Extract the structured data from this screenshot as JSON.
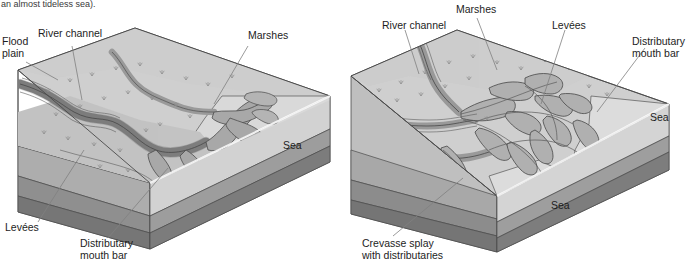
{
  "figure": {
    "caption_fragment": "an almost tideless sea).",
    "type": "block-diagram",
    "panels": 2
  },
  "colors": {
    "plain_top": "#c9c9c9",
    "plain_top_light": "#d6d6d6",
    "channel_fill": "#a6a6a6",
    "channel_dark": "#8f8f8f",
    "sea_surface": "#cfcfcf",
    "sea_light": "#e2e2e2",
    "block_face_upper": "#bdbdbd",
    "block_face_mid": "#9a9a9a",
    "block_face_lower": "#808080",
    "block_face_base": "#6f6f6f",
    "outline": "#4a4a4a",
    "leader": "#777777",
    "text": "#1d1d1d"
  },
  "left_panel": {
    "name": "birds-foot-delta-simple",
    "labels": [
      {
        "id": "flood-plain",
        "text": "Flood\nplain",
        "line1": "Flood",
        "line2": "plain"
      },
      {
        "id": "river-channel",
        "text": "River channel",
        "line1": "River channel",
        "line2": ""
      },
      {
        "id": "marshes",
        "text": "Marshes",
        "line1": "Marshes",
        "line2": ""
      },
      {
        "id": "sea",
        "text": "Sea",
        "line1": "Sea",
        "line2": ""
      },
      {
        "id": "levees",
        "text": "Levées",
        "line1": "Levées",
        "line2": ""
      },
      {
        "id": "distributary-mouth-bar",
        "text": "Distributary\nmouth bar",
        "line1": "Distributary",
        "line2": "mouth bar"
      }
    ]
  },
  "right_panel": {
    "name": "birds-foot-delta-complex",
    "labels": [
      {
        "id": "river-channel",
        "text": "River channel",
        "line1": "River channel",
        "line2": ""
      },
      {
        "id": "marshes",
        "text": "Marshes",
        "line1": "Marshes",
        "line2": ""
      },
      {
        "id": "levees",
        "text": "Levées",
        "line1": "Levées",
        "line2": ""
      },
      {
        "id": "distributary-mouth-bar",
        "text": "Distributary\nmouth bar",
        "line1": "Distributary",
        "line2": "mouth bar"
      },
      {
        "id": "sea-right",
        "text": "Sea",
        "line1": "Sea",
        "line2": ""
      },
      {
        "id": "sea-lower",
        "text": "Sea",
        "line1": "Sea",
        "line2": ""
      },
      {
        "id": "crevasse-splay",
        "text": "Crevasse splay\nwith distributaries",
        "line1": "Crevasse splay",
        "line2": "with distributaries"
      }
    ]
  }
}
